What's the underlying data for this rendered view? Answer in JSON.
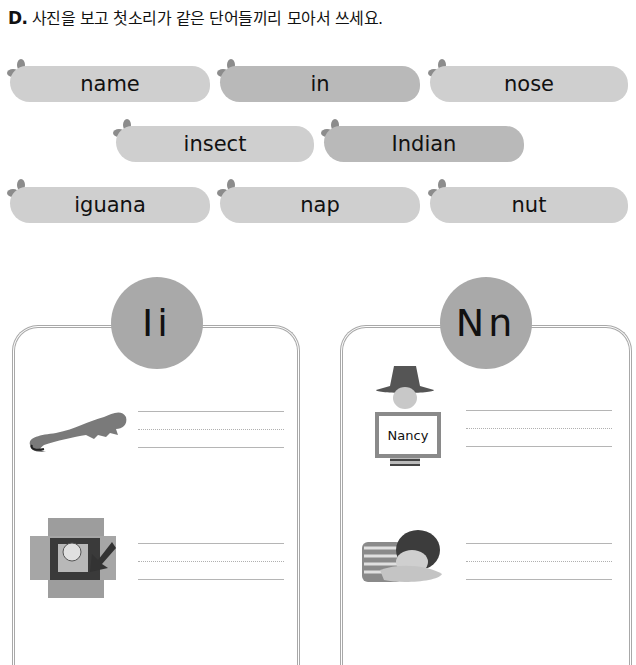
{
  "instruction": {
    "letter": "D.",
    "text": "사진을 보고 첫소리가 같은 단어들끼리 모아서 쓰세요."
  },
  "word_bank": [
    {
      "word": "name",
      "shade": "light"
    },
    {
      "word": "in",
      "shade": "dark"
    },
    {
      "word": "nose",
      "shade": "light"
    },
    {
      "word": "insect",
      "shade": "light"
    },
    {
      "word": "Indian",
      "shade": "dark"
    },
    {
      "word": "iguana",
      "shade": "light"
    },
    {
      "word": "nap",
      "shade": "light"
    },
    {
      "word": "nut",
      "shade": "light"
    }
  ],
  "panels": [
    {
      "letter_label": "Ii",
      "items": [
        {
          "picture": "iguana-picture"
        },
        {
          "picture": "gift-in-box-picture"
        }
      ]
    },
    {
      "letter_label": "Nn",
      "items": [
        {
          "picture": "girl-holding-name-sign-picture",
          "sign_text": "Nancy"
        },
        {
          "picture": "boy-napping-picture"
        }
      ]
    }
  ],
  "colors": {
    "pill_light": "#cfcfcf",
    "pill_dark": "#b9b9b9",
    "circle": "#a9a9a9",
    "panel_border": "#a8a8a8",
    "leaf": "#8c8c8c"
  }
}
